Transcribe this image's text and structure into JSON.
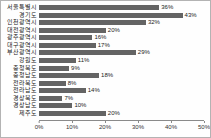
{
  "chart_data": {
    "type": "bar",
    "orientation": "horizontal",
    "title": "",
    "xlabel": "",
    "ylabel": "",
    "grid": false,
    "legend": false,
    "xlim": [
      0,
      50
    ],
    "x_ticks": [
      "0%",
      "10%",
      "20%",
      "30%",
      "40%",
      "50%"
    ],
    "x_tick_values": [
      0,
      10,
      20,
      30,
      40,
      50
    ],
    "bar_color": "#646464",
    "categories": [
      "서울특별시",
      "경기도",
      "인천광역시",
      "대전광역시",
      "광주광역시",
      "대구광역시",
      "부산광역시",
      "강원도",
      "충청북도",
      "충청남도",
      "전라북도",
      "전라남도",
      "경상북도",
      "경상남도",
      "제주도"
    ],
    "values": [
      36,
      43,
      32,
      20,
      16,
      17,
      29,
      11,
      9,
      18,
      8,
      14,
      7,
      10,
      20
    ],
    "value_labels": [
      "36%",
      "43%",
      "32%",
      "20%",
      "16%",
      "17%",
      "29%",
      "11%",
      "9%",
      "18%",
      "8%",
      "14%",
      "7%",
      "10%",
      "20%"
    ]
  }
}
